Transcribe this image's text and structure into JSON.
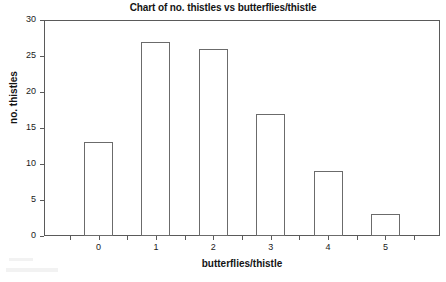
{
  "chart_data": {
    "type": "bar",
    "title": "Chart of no. thistles vs butterflies/thistle",
    "xlabel": "butterflies/thistle",
    "ylabel": "no. thistles",
    "categories": [
      "0",
      "1",
      "2",
      "3",
      "4",
      "5"
    ],
    "values": [
      13,
      27,
      26,
      17,
      9,
      3
    ],
    "ylim": [
      0,
      30
    ],
    "y_ticks": [
      "0",
      "5",
      "10",
      "15",
      "20",
      "25",
      "30"
    ],
    "y_tick_values": [
      0,
      5,
      10,
      15,
      20,
      25,
      30
    ],
    "x_ticks": [
      "0",
      "1",
      "2",
      "3",
      "4",
      "5"
    ],
    "grid": "none",
    "legend": "none",
    "bar_fill": "#ffffff",
    "bar_edge": "#6b6b6b",
    "axis_color": "#5a5a5a",
    "text_color": "#141414",
    "background": "#ffffff"
  }
}
